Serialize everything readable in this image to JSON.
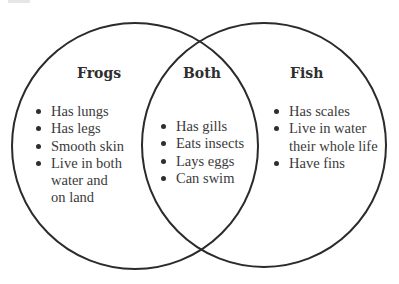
{
  "diagram": {
    "type": "venn",
    "stroke_color": "#2b2b2b",
    "sets": [
      {
        "id": "frogs",
        "title": "Frogs",
        "circle": {
          "cx": 135,
          "cy": 146,
          "r": 123
        },
        "items": [
          "Has lungs",
          "Has legs",
          "Smooth skin",
          "Live in both water and on land"
        ],
        "lines": [
          [
            "Has lungs"
          ],
          [
            "Has legs"
          ],
          [
            "Smooth skin"
          ],
          [
            "Live in both",
            "water and",
            "on land"
          ]
        ]
      },
      {
        "id": "both",
        "title": "Both",
        "items": [
          "Has gills",
          "Eats insects",
          "Lays eggs",
          "Can swim"
        ],
        "lines": [
          [
            "Has gills"
          ],
          [
            "Eats insects"
          ],
          [
            "Lays eggs"
          ],
          [
            "Can swim"
          ]
        ]
      },
      {
        "id": "fish",
        "title": "Fish",
        "circle": {
          "cx": 264,
          "cy": 145,
          "r": 122
        },
        "items": [
          "Has scales",
          "Live in water their whole life",
          "Have fins"
        ],
        "lines": [
          [
            "Has scales"
          ],
          [
            "Live in water",
            "their whole life"
          ],
          [
            "Have fins"
          ]
        ]
      }
    ]
  }
}
